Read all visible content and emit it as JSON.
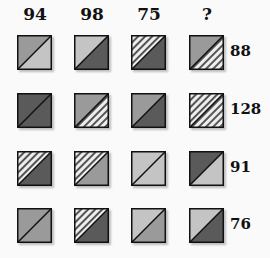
{
  "puzzle": {
    "column_values": [
      "94",
      "98",
      "75",
      "?"
    ],
    "row_values": [
      "88",
      "128",
      "91",
      "76"
    ],
    "fills": {
      "light": "#c4c4c4",
      "medium": "#9a9a9a",
      "dark": "#5a5a5a",
      "hatched": "hatch"
    },
    "grid": [
      [
        {
          "upper_left": "medium",
          "lower_right": "light"
        },
        {
          "upper_left": "light",
          "lower_right": "dark"
        },
        {
          "upper_left": "hatched",
          "lower_right": "dark"
        },
        {
          "upper_left": "medium",
          "lower_right": "hatched"
        }
      ],
      [
        {
          "upper_left": "dark",
          "lower_right": "dark"
        },
        {
          "upper_left": "medium",
          "lower_right": "hatched"
        },
        {
          "upper_left": "medium",
          "lower_right": "dark"
        },
        {
          "upper_left": "hatched",
          "lower_right": "hatched"
        }
      ],
      [
        {
          "upper_left": "hatched",
          "lower_right": "dark"
        },
        {
          "upper_left": "hatched",
          "lower_right": "medium"
        },
        {
          "upper_left": "light",
          "lower_right": "light"
        },
        {
          "upper_left": "dark",
          "lower_right": "light"
        }
      ],
      [
        {
          "upper_left": "medium",
          "lower_right": "medium"
        },
        {
          "upper_left": "hatched",
          "lower_right": "dark"
        },
        {
          "upper_left": "light",
          "lower_right": "medium"
        },
        {
          "upper_left": "light",
          "lower_right": "dark"
        }
      ]
    ]
  }
}
